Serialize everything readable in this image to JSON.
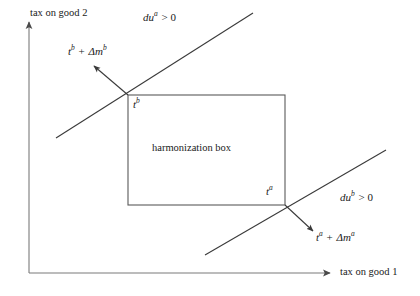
{
  "figure": {
    "type": "economics-diagram",
    "background_color": "#ffffff",
    "line_color": "#3a3a3a",
    "text_color": "#1a1a1a"
  },
  "axes": {
    "x_label": "tax on good 1",
    "y_label": "tax on good 2",
    "origin": {
      "x": 29,
      "y": 273
    },
    "x_axis_end": {
      "x": 330,
      "y": 273
    },
    "y_axis_end": {
      "x": 29,
      "y": 22
    },
    "arrow_style": "solid-triangle"
  },
  "box": {
    "label": "harmonization box",
    "left": 128,
    "top": 95,
    "right": 285,
    "bottom": 205,
    "label_x": 152,
    "label_y": 143
  },
  "points": [
    {
      "id": "tb",
      "base": "t",
      "superscript": "b",
      "x": 128,
      "y": 95,
      "label_x": 133,
      "label_y": 99
    },
    {
      "id": "ta",
      "base": "t",
      "superscript": "a",
      "x": 285,
      "y": 205,
      "label_x": 266,
      "label_y": 186
    }
  ],
  "indifference_lines": [
    {
      "id": "upper-line",
      "x1": 56,
      "y1": 138,
      "x2": 253,
      "y2": 13
    },
    {
      "id": "lower-line",
      "x1": 205,
      "y1": 255,
      "x2": 386,
      "y2": 150
    }
  ],
  "gradient_arrows": [
    {
      "id": "tb-arrow",
      "from_x": 128,
      "from_y": 95,
      "to_x": 92,
      "to_y": 64
    },
    {
      "id": "ta-arrow",
      "from_x": 285,
      "from_y": 205,
      "to_x": 315,
      "to_y": 233
    }
  ],
  "annotations": {
    "du_a": {
      "base": "du",
      "superscript": "a",
      "relation": "> 0",
      "full_text": "du^a > 0",
      "x": 143,
      "y": 12
    },
    "du_b": {
      "base": "du",
      "superscript": "b",
      "relation": "> 0",
      "full_text": "du^b > 0",
      "x": 340,
      "y": 192
    },
    "tb_shift": {
      "base": "t",
      "superscript": "b",
      "operator": "+",
      "delta": "Δm",
      "delta_superscript": "b",
      "full_text": "t^b + Δm^b",
      "x": 68,
      "y": 46
    },
    "ta_shift": {
      "base": "t",
      "superscript": "a",
      "operator": "+",
      "delta": "Δm",
      "delta_superscript": "a",
      "full_text": "t^a + Δm^a",
      "x": 316,
      "y": 232
    }
  }
}
